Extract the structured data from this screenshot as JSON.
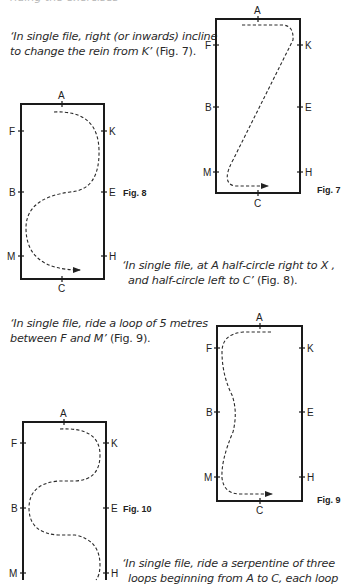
{
  "header_fragment": "riding the exercises",
  "captions": {
    "fig7": {
      "line1": "‘In single file, right (or inwards) incline",
      "line2": "to change the rein from K’",
      "ref": " (Fig. 7)."
    },
    "fig8": {
      "line1": "‘In single file, at A half-circle right to X  ,",
      "line2": "and half-circle left to C’",
      "ref": " (Fig. 8)."
    },
    "fig9": {
      "line1": "‘In single file, ride a loop of 5 metres",
      "line2": "between F and M’",
      "ref": " (Fig. 9)."
    },
    "fig10": {
      "line1": "‘In single file, ride a serpentine of three",
      "line2": "loops beginning from A to C, each loop"
    }
  },
  "figures": {
    "fig7": {
      "label": "Fig. 7",
      "markers": {
        "A": "A",
        "C": "C",
        "F": "F",
        "K": "K",
        "B": "B",
        "E": "E",
        "M": "M",
        "H": "H"
      }
    },
    "fig8": {
      "label": "Fig. 8",
      "markers": {
        "A": "A",
        "C": "C",
        "F": "F",
        "K": "K",
        "B": "B",
        "E": "E",
        "M": "M",
        "H": "H"
      }
    },
    "fig9": {
      "label": "Fig. 9",
      "markers": {
        "A": "A",
        "C": "C",
        "F": "F",
        "K": "K",
        "B": "B",
        "E": "E",
        "M": "M",
        "H": "H"
      }
    },
    "fig10": {
      "label": "Fig. 10",
      "markers": {
        "A": "A",
        "F": "F",
        "K": "K",
        "B": "B",
        "E": "E",
        "M": "M",
        "H": "H"
      }
    }
  }
}
